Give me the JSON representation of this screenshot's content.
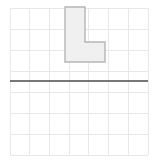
{
  "figure": {
    "title": "",
    "type": "geometry-grid-diagram",
    "canvas": {
      "width": 156,
      "height": 163,
      "background": "#ffffff"
    },
    "grid": {
      "name": "square-grid",
      "left": 10,
      "top": 8,
      "right": 148,
      "bottom": 155,
      "columns": 7,
      "rows": 7,
      "cell_width": 19.71,
      "cell_height": 21.0,
      "line_color": "#e8e8e8",
      "line_width": 1,
      "border_color": "#e8e8e8"
    },
    "axis_line": {
      "name": "mirror-line",
      "orientation": "horizontal",
      "y": 81,
      "x_start": 10,
      "x_end": 148,
      "color": "#4a4a4a",
      "line_width": 1.6
    },
    "shape": {
      "name": "l-shape-polygon",
      "label": "L",
      "fill": "#f0f0f0",
      "stroke": "#b5b5b5",
      "stroke_width": 1.4,
      "points": [
        [
          65,
          7
        ],
        [
          85,
          7
        ],
        [
          85,
          42
        ],
        [
          105,
          42
        ],
        [
          105,
          62
        ],
        [
          65,
          62
        ]
      ]
    }
  }
}
